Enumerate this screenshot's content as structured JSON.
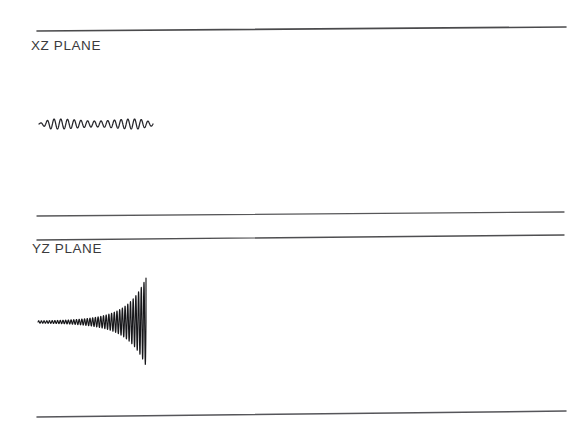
{
  "figure": {
    "background_color": "#ffffff",
    "ink_color": "#3a3a3c",
    "trace_color": "#1d1d1f",
    "width": 584,
    "height": 434
  },
  "panels": [
    {
      "id": "xz",
      "label": "XZ PLANE",
      "rules": [
        {
          "name": "top-rule",
          "x1": 37,
          "y1": 31,
          "x2": 566,
          "y2": 27
        },
        {
          "name": "bottom-rule",
          "x1": 37,
          "y1": 216,
          "x2": 564,
          "y2": 212
        }
      ],
      "trace": {
        "name": "xz-oscillation",
        "description": "low constant amplitude oscillation",
        "baseline_y": 124,
        "x_start": 39,
        "x_end": 153,
        "cycles": 17,
        "amplitude_start": 0.6,
        "amplitude_peak": 5.0,
        "amplitude_end": 2.4,
        "growth": "flat"
      }
    },
    {
      "id": "yz",
      "label": "YZ PLANE",
      "rules": [
        {
          "name": "top-rule",
          "x1": 37,
          "y1": 240,
          "x2": 564,
          "y2": 235
        },
        {
          "name": "bottom-rule",
          "x1": 37,
          "y1": 417,
          "x2": 566,
          "y2": 411
        }
      ],
      "trace": {
        "name": "yz-diverging-oscillation",
        "description": "exponentially growing oscillation terminating abruptly",
        "baseline_y": 322,
        "x_start": 38,
        "x_end": 146,
        "cycles": 40,
        "amplitude_start": 1.2,
        "amplitude_end": 44.0,
        "growth": "exponential"
      }
    }
  ],
  "chart_data": {
    "type": "line",
    "title": "",
    "xlabel": "",
    "ylabel": "",
    "legend": [],
    "grid": false,
    "series": [
      {
        "name": "XZ PLANE",
        "description": "Steady low-amplitude oscillation about a flat baseline",
        "envelope": "constant",
        "cycles": 17,
        "amplitude_units_px": {
          "start": 0.6,
          "max": 5.0,
          "end": 2.4
        },
        "x_extent_px": [
          39,
          153
        ],
        "baseline_y_px": 124
      },
      {
        "name": "YZ PLANE",
        "description": "Exponentially diverging oscillation, amplitude grows from near zero to full panel height then cuts off",
        "envelope": "exponential",
        "cycles": 40,
        "amplitude_units_px": {
          "start": 1.2,
          "max": 44.0,
          "end": 44.0
        },
        "x_extent_px": [
          38,
          146
        ],
        "baseline_y_px": 322
      }
    ]
  }
}
